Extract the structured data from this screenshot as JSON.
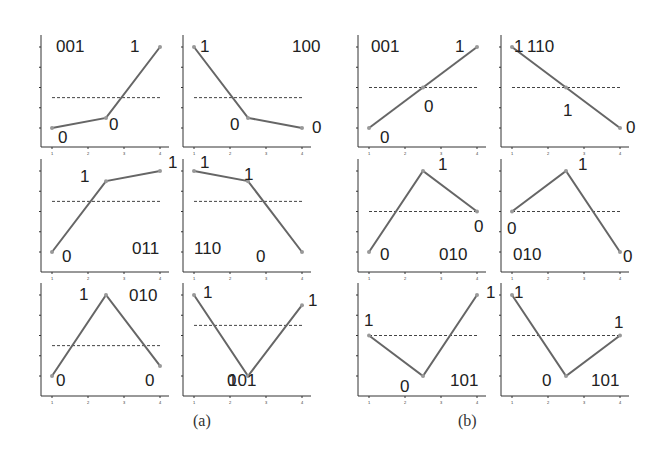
{
  "figure": {
    "captions": [
      "(a)",
      "(b)"
    ],
    "colors": {
      "line": "#666666",
      "axis": "#333333",
      "dashed": "#444444",
      "text": "#222222",
      "point": "#999999"
    }
  },
  "chart_data": [
    {
      "group": "a",
      "type": "line",
      "label": "001",
      "x": [
        1,
        2.5,
        4
      ],
      "y": [
        1,
        1.5,
        5
      ],
      "threshold": 2.5,
      "point_labels": [
        "0",
        "0",
        "1"
      ]
    },
    {
      "group": "a",
      "type": "line",
      "label": "100",
      "x": [
        1,
        2.5,
        4
      ],
      "y": [
        5,
        1.5,
        1
      ],
      "threshold": 2.5,
      "point_labels": [
        "1",
        "0",
        "0"
      ]
    },
    {
      "group": "a",
      "type": "line",
      "label": "011",
      "x": [
        1,
        2.5,
        4
      ],
      "y": [
        1,
        4.5,
        5
      ],
      "threshold": 3.5,
      "point_labels": [
        "0",
        "1",
        "1"
      ]
    },
    {
      "group": "a",
      "type": "line",
      "label": "110",
      "x": [
        1,
        2.5,
        4
      ],
      "y": [
        5,
        4.5,
        1
      ],
      "threshold": 3.5,
      "point_labels": [
        "1",
        "1",
        "0"
      ]
    },
    {
      "group": "a",
      "type": "line",
      "label": "010",
      "x": [
        1,
        2.5,
        4
      ],
      "y": [
        1,
        5,
        1.5
      ],
      "threshold": 2.5,
      "point_labels": [
        "0",
        "1",
        "0"
      ]
    },
    {
      "group": "a",
      "type": "line",
      "label": "101",
      "x": [
        1,
        2.5,
        4
      ],
      "y": [
        5,
        1,
        4.5
      ],
      "threshold": 3.5,
      "point_labels": [
        "1",
        "0",
        "1"
      ]
    },
    {
      "group": "b",
      "type": "line",
      "label": "001",
      "x": [
        1,
        2.5,
        4
      ],
      "y": [
        1,
        3,
        5
      ],
      "threshold": 3,
      "point_labels": [
        "0",
        "0",
        "1"
      ]
    },
    {
      "group": "b",
      "type": "line",
      "label": "110",
      "x": [
        1,
        2.5,
        4
      ],
      "y": [
        5,
        3,
        1
      ],
      "threshold": 3,
      "point_labels": [
        "1",
        "1",
        "0"
      ]
    },
    {
      "group": "b",
      "type": "line",
      "label": "010",
      "x": [
        1,
        2.5,
        4
      ],
      "y": [
        1,
        5,
        3
      ],
      "threshold": 3,
      "point_labels": [
        "0",
        "1",
        "0"
      ]
    },
    {
      "group": "b",
      "type": "line",
      "label": "010",
      "x": [
        1,
        2.5,
        4
      ],
      "y": [
        3,
        5,
        1
      ],
      "threshold": 3,
      "point_labels": [
        "0",
        "1",
        "0"
      ]
    },
    {
      "group": "b",
      "type": "line",
      "label": "101",
      "x": [
        1,
        2.5,
        4
      ],
      "y": [
        3,
        1,
        5
      ],
      "threshold": 3,
      "point_labels": [
        "1",
        "0",
        "1"
      ]
    },
    {
      "group": "b",
      "type": "line",
      "label": "101",
      "x": [
        1,
        2.5,
        4
      ],
      "y": [
        5,
        1,
        3
      ],
      "threshold": 3,
      "point_labels": [
        "1",
        "0",
        "1"
      ]
    }
  ],
  "layout": {
    "panel_x": [
      41,
      183,
      358,
      501
    ],
    "row_y5": [
      47,
      171,
      295
    ],
    "row_axis": [
      147,
      272,
      396
    ],
    "x_tick_ticks": [
      1,
      2,
      3,
      4
    ]
  }
}
